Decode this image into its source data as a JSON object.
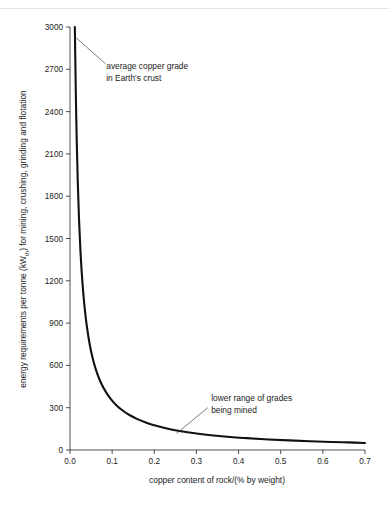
{
  "figure": {
    "background_color": "#ffffff",
    "rule_color": "#e2e2e2",
    "curve_color": "#111111",
    "axis_color": "#3a3a3a",
    "text_color": "#1a1a1a"
  },
  "chart_data": {
    "type": "line",
    "title": "",
    "xlabel": "copper content of rock/(% by weight)",
    "ylabel_parts": {
      "before": "energy requirements per tonne (kW",
      "subscript": "th",
      "after": ") for mining, crushing, grinding and flotation"
    },
    "ylabel": "energy requirements per tonne (kWth) for mining, crushing, grinding and flotation",
    "xlim": [
      0.0,
      0.7
    ],
    "ylim": [
      0,
      3000
    ],
    "xticks": [
      0.0,
      0.1,
      0.2,
      0.3,
      0.4,
      0.5,
      0.6,
      0.7
    ],
    "xtick_labels": [
      "0.0",
      "0.1",
      "0.2",
      "0.3",
      "0.4",
      "0.5",
      "0.6",
      "0.7"
    ],
    "yticks": [
      0,
      300,
      600,
      900,
      1200,
      1500,
      1800,
      2100,
      2400,
      2700,
      3000
    ],
    "ytick_labels": [
      "0",
      "300",
      "600",
      "900",
      "1200",
      "1500",
      "1800",
      "2100",
      "2400",
      "2700",
      "3000"
    ],
    "grid": false,
    "legend": null,
    "series": [
      {
        "name": "energy requirement vs copper grade",
        "x": [
          0.0115,
          0.0125,
          0.014,
          0.016,
          0.0185,
          0.0215,
          0.025,
          0.029,
          0.034,
          0.04,
          0.047,
          0.055,
          0.064,
          0.074,
          0.085,
          0.097,
          0.11,
          0.125,
          0.14,
          0.16,
          0.18,
          0.2,
          0.23,
          0.26,
          0.3,
          0.34,
          0.38,
          0.42,
          0.47,
          0.52,
          0.57,
          0.62,
          0.66,
          0.7
        ],
        "y": [
          3000,
          2790,
          2500,
          2190,
          1895,
          1630,
          1400,
          1208,
          1030,
          876,
          745,
          637,
          547,
          473,
          412,
          361,
          318,
          280,
          250,
          219,
          195,
          175,
          153,
          135,
          117,
          103,
          92,
          84,
          75,
          68,
          62,
          57,
          54,
          50
        ]
      }
    ],
    "annotations": [
      {
        "id": "average-copper-grade",
        "text_lines": [
          "average copper grade",
          "in Earth's crust"
        ],
        "text_x": 0.086,
        "text_y": 2700,
        "pointer_from_x": 0.084,
        "pointer_from_y": 2740,
        "pointer_to_x": 0.012,
        "pointer_to_y": 2930
      },
      {
        "id": "lower-range-of-grades",
        "text_lines": [
          "lower range of grades",
          "being mined"
        ],
        "text_x": 0.335,
        "text_y": 345,
        "pointer_from_x": 0.327,
        "pointer_from_y": 300,
        "pointer_to_x": 0.253,
        "pointer_to_y": 118
      }
    ]
  }
}
